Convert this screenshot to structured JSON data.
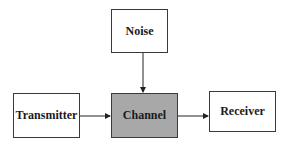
{
  "diagram": {
    "type": "block-diagram",
    "nodes": [
      {
        "id": "noise",
        "label": "Noise",
        "fill": "#ffffff"
      },
      {
        "id": "transmitter",
        "label": "Transmitter",
        "fill": "#ffffff"
      },
      {
        "id": "channel",
        "label": "Channel",
        "fill": "#a8a8a8"
      },
      {
        "id": "receiver",
        "label": "Receiver",
        "fill": "#ffffff"
      }
    ],
    "edges": [
      {
        "from": "noise",
        "to": "channel"
      },
      {
        "from": "transmitter",
        "to": "channel"
      },
      {
        "from": "channel",
        "to": "receiver"
      }
    ]
  }
}
